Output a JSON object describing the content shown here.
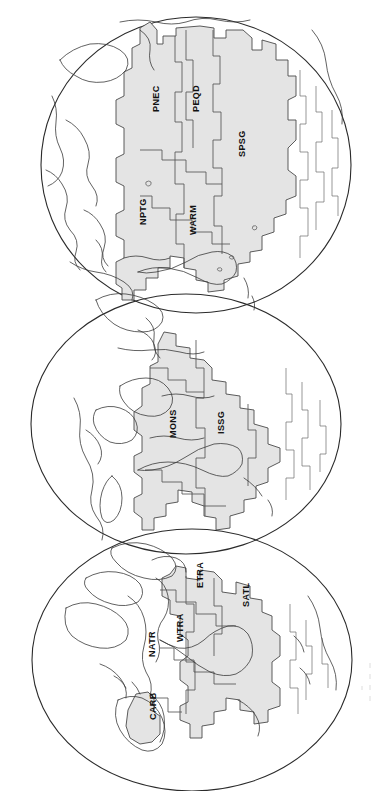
{
  "figure": {
    "orientation": "page rotated 90 degrees; province labels read bottom-to-top",
    "background_color": "#ffffff",
    "province_fill_color": "#e4e4e4",
    "outline_color": "#4a4a4a",
    "coastline_color": "#3a3a3a"
  },
  "globes": [
    {
      "id": "globe-pacific",
      "name": "Pacific Ocean hemisphere",
      "position": "top",
      "provinces": [
        {
          "code": "PNEC",
          "name": "North Pacific Equatorial Countercurrent"
        },
        {
          "code": "PEQD",
          "name": "Pacific Equatorial Divergence"
        },
        {
          "code": "SPSG",
          "name": "South Pacific Subtropical Gyre"
        },
        {
          "code": "NPTG",
          "name": "North Pacific Tropical Gyre"
        },
        {
          "code": "WARM",
          "name": "Western Pacific Warm Pool"
        }
      ]
    },
    {
      "id": "globe-indian",
      "name": "Indian Ocean hemisphere",
      "position": "middle",
      "provinces": [
        {
          "code": "MONS",
          "name": "Indian Monsoon Gyres"
        },
        {
          "code": "ISSG",
          "name": "Indian South Subtropical Gyre"
        }
      ]
    },
    {
      "id": "globe-atlantic",
      "name": "Atlantic Ocean hemisphere",
      "position": "bottom",
      "provinces": [
        {
          "code": "CARB",
          "name": "Caribbean"
        },
        {
          "code": "NATR",
          "name": "North Atlantic Tropical Gyre"
        },
        {
          "code": "WTRA",
          "name": "Western Tropical Atlantic"
        },
        {
          "code": "ETRA",
          "name": "Eastern Tropical Atlantic"
        },
        {
          "code": "SATL",
          "name": "South Atlantic Gyre"
        }
      ]
    }
  ],
  "labels": {
    "pnec": "PNEC",
    "peqd": "PEQD",
    "spsg": "SPSG",
    "nptg": "NPTG",
    "warm": "WARM",
    "mons": "MONS",
    "issg": "ISSG",
    "carb": "CARB",
    "natr": "NATR",
    "wtra": "WTRA",
    "etra": "ETRA",
    "satl": "SATL"
  }
}
